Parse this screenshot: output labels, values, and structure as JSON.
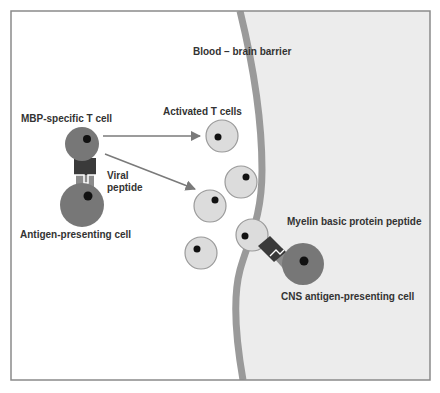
{
  "labels": {
    "barrier": "Blood – brain barrier",
    "mbp_t_cell": "MBP-specific T cell",
    "activated_t_cells": "Activated T cells",
    "viral_peptide_line1": "Viral",
    "viral_peptide_line2": "peptide",
    "antigen_presenting_cell": "Antigen-presenting cell",
    "myelin_peptide": "Myelin basic protein peptide",
    "cns_apc": "CNS antigen-presenting cell"
  },
  "colors": {
    "frame": "#8a8a8a",
    "blood_side": "#ffffff",
    "brain_side": "#ededed",
    "barrier": "#9a9a9a",
    "dark_cell": "#777777",
    "light_cell": "#dcdcdc",
    "light_cell_stroke": "#9a9a9a",
    "nucleus": "#111111",
    "receptor": "#3a3a3a",
    "mhc": "#8c8c8c",
    "arrow": "#7a7a7a",
    "text": "#333333"
  },
  "activated_t_cells": [
    {
      "cx": 222,
      "cy": 136,
      "r": 16,
      "nx": 218,
      "ny": 137
    },
    {
      "cx": 241,
      "cy": 182,
      "r": 16,
      "nx": 246,
      "ny": 177
    },
    {
      "cx": 210,
      "cy": 206,
      "r": 16,
      "nx": 215,
      "ny": 200
    },
    {
      "cx": 252,
      "cy": 235,
      "r": 16,
      "nx": 245,
      "ny": 236
    },
    {
      "cx": 201,
      "cy": 253,
      "r": 16,
      "nx": 197,
      "ny": 249
    }
  ]
}
